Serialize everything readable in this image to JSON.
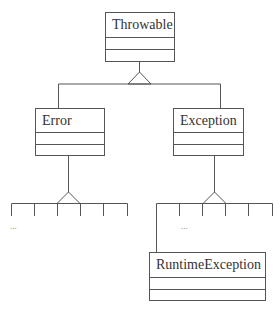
{
  "diagram": {
    "type": "UML class hierarchy",
    "line_color": "#555555",
    "classes": [
      {
        "id": "throwable",
        "name": "Throwable"
      },
      {
        "id": "error",
        "name": "Error"
      },
      {
        "id": "exception",
        "name": "Exception"
      },
      {
        "id": "runtime-exception",
        "name": "RuntimeException"
      }
    ],
    "relationships": [
      {
        "type": "generalization",
        "parent": "Throwable",
        "children": [
          "Error",
          "Exception"
        ]
      },
      {
        "type": "generalization",
        "parent": "Error",
        "children": [
          "..."
        ]
      },
      {
        "type": "generalization",
        "parent": "Exception",
        "children": [
          "RuntimeException",
          "..."
        ]
      }
    ],
    "ellipsis_left": "...",
    "ellipsis_right": "..."
  }
}
